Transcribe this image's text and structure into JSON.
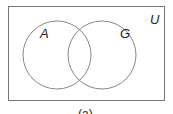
{
  "diagram": {
    "type": "venn",
    "universe_label": "U",
    "sets": [
      {
        "label": "A"
      },
      {
        "label": "G"
      }
    ],
    "caption": "(a)"
  }
}
